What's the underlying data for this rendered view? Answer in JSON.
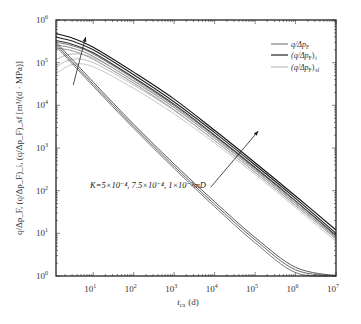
{
  "chart_data": {
    "type": "line",
    "title": "",
    "xlabel": "t_ca (d)",
    "ylabel": "q/Δp_F, (q/Δp_F)_i, (q/Δp_F)_sf [m³/(d·MPa)]",
    "xscale": "log",
    "yscale": "log",
    "xlim": [
      1.2,
      10000000
    ],
    "ylim": [
      1,
      1000000
    ],
    "x_ticks": [
      "10^1",
      "10^2",
      "10^3",
      "10^4",
      "10^5",
      "10^6",
      "10^7"
    ],
    "y_ticks": [
      "10^0",
      "10^1",
      "10^2",
      "10^3",
      "10^4",
      "10^5",
      "10^6"
    ],
    "grid": false,
    "legend_position": "upper right",
    "legend": [
      {
        "label": "q/Δp_F",
        "color": "#555555"
      },
      {
        "label": "(q/Δp_F)_i",
        "color": "#111111"
      },
      {
        "label": "(q/Δp_F)_sf",
        "color": "#aaaaaa"
      }
    ],
    "annotation": "K=5×10⁻⁴, 7.5×10⁻⁴, 1×10⁻³mD",
    "arrows": [
      {
        "from": [
          3.2,
          30000
        ],
        "to": [
          6.5,
          400000
        ]
      },
      {
        "from": [
          8000,
          120
        ],
        "to": [
          120000,
          2500
        ]
      }
    ],
    "x": [
      1.2,
      3,
      10,
      100,
      1000,
      10000,
      100000,
      1000000,
      10000000
    ],
    "series": [
      {
        "name": "(q/Δp_F)_i K=1e-3",
        "color": "#111111",
        "width": 1.1,
        "values": [
          480000,
          380000,
          230000,
          60000,
          14000,
          2600,
          450,
          75,
          12
        ]
      },
      {
        "name": "(q/Δp_F)_i K=7.5e-4",
        "color": "#222222",
        "width": 1.1,
        "values": [
          400000,
          320000,
          200000,
          52000,
          12000,
          2300,
          400,
          66,
          10
        ]
      },
      {
        "name": "(q/Δp_F)_i K=5e-4",
        "color": "#333333",
        "width": 1.1,
        "values": [
          330000,
          270000,
          170000,
          45000,
          10500,
          2000,
          350,
          58,
          9
        ]
      },
      {
        "name": "q/Δp_F K=1e-3",
        "color": "#666666",
        "width": 0.9,
        "values": [
          300000,
          250000,
          160000,
          42000,
          9800,
          1900,
          330,
          56,
          8.5
        ]
      },
      {
        "name": "q/Δp_F K=7.5e-4",
        "color": "#777777",
        "width": 0.9,
        "values": [
          260000,
          220000,
          140000,
          37000,
          8800,
          1700,
          300,
          50,
          8
        ]
      },
      {
        "name": "q/Δp_F K=5e-4",
        "color": "#888888",
        "width": 0.9,
        "values": [
          220000,
          190000,
          120000,
          33000,
          7800,
          1500,
          270,
          45,
          7.5
        ]
      },
      {
        "name": "(q/Δp_F)_sf K=1e-3",
        "color": "#aaaaaa",
        "width": 0.9,
        "values": [
          120000,
          160000,
          130000,
          38000,
          9000,
          1750,
          310,
          52,
          8
        ]
      },
      {
        "name": "(q/Δp_F)_sf K=7.5e-4",
        "color": "#b5b5b5",
        "width": 0.9,
        "values": [
          80000,
          120000,
          100000,
          30000,
          7500,
          1500,
          270,
          46,
          7.2
        ]
      },
      {
        "name": "(q/Δp_F)_sf K=5e-4",
        "color": "#c0c0c0",
        "width": 0.9,
        "values": [
          55000,
          90000,
          80000,
          25000,
          6300,
          1300,
          240,
          40,
          6.5
        ]
      },
      {
        "name": "lower K=1e-3",
        "color": "#444444",
        "width": 0.9,
        "values": [
          300000,
          120000,
          35000,
          3600,
          420,
          55,
          8,
          1.6,
          1
        ]
      },
      {
        "name": "lower K=7.5e-4",
        "color": "#555555",
        "width": 0.9,
        "values": [
          270000,
          105000,
          31000,
          3200,
          370,
          48,
          7,
          1.4,
          1
        ]
      },
      {
        "name": "lower K=5e-4",
        "color": "#666666",
        "width": 0.9,
        "values": [
          240000,
          95000,
          28000,
          2900,
          330,
          42,
          6,
          1.2,
          1
        ]
      }
    ]
  },
  "labels": {
    "x_axis": "t",
    "x_axis_sub": "ca",
    "x_axis_unit": "(d)",
    "y_axis": "q/Δp_F, (q/Δp_F)_i, (q/Δp_F)_sf [m³/(d · MPa)]",
    "annotation": "K=5×10⁻⁴, 7.5×10⁻⁴, 1×10⁻³mD",
    "legend_1": "q/Δp",
    "legend_1_sub": "F",
    "legend_2": "(q/Δp",
    "legend_2_sub": "F",
    "legend_2_tail": ")",
    "legend_2_tail_sub": "i",
    "legend_3": "(q/Δp",
    "legend_3_sub": "F",
    "legend_3_tail": ")",
    "legend_3_tail_sub": "sf"
  }
}
